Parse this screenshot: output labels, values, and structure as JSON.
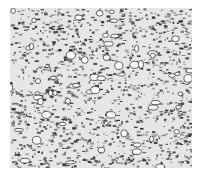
{
  "image": {
    "description": "Grayscale micrograph showing dense granular microstructure with dark grain boundaries and light rounded grains",
    "background_color": "#ffffff",
    "texture_base_color": "#e6e6e6",
    "boundary_color": "#2a2a2a",
    "region": {
      "x": 10,
      "y": 8,
      "width": 182,
      "height": 160
    }
  }
}
